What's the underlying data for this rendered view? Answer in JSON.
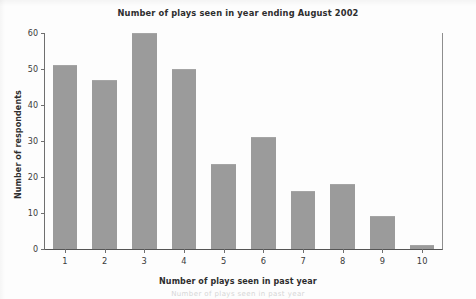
{
  "chart_data": {
    "type": "bar",
    "title": "Number of plays seen in year ending August 2002",
    "xlabel": "Number of plays seen in past year",
    "ylabel": "Number of respondents",
    "categories": [
      "1",
      "2",
      "3",
      "4",
      "5",
      "6",
      "7",
      "8",
      "9",
      "10"
    ],
    "values": [
      51,
      47,
      60,
      50,
      23.5,
      31,
      16,
      18,
      9.3,
      1
    ],
    "ylim": [
      0,
      60
    ],
    "yticks": [
      0,
      10,
      20,
      30,
      40,
      50,
      60
    ],
    "ytick_labels": [
      "0",
      "10",
      "20",
      "30",
      "40",
      "50",
      "60"
    ],
    "grid": false,
    "legend": null,
    "bar_color": "#9b9b9b",
    "axis_color": "#6f6f6f",
    "background_color": "#fdfdfd"
  },
  "page": {
    "bottom_partial_text": "Number of plays seen in past year"
  }
}
